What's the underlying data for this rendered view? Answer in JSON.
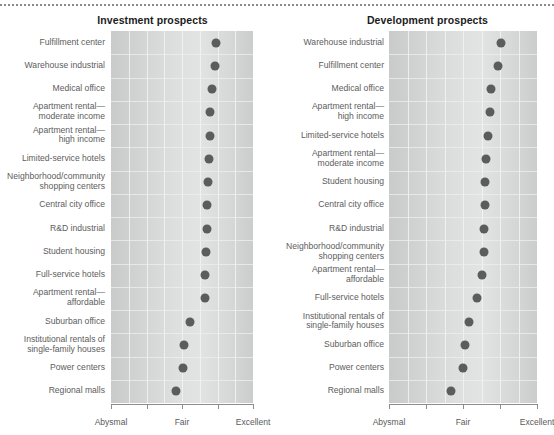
{
  "figure": {
    "top_rule": "dotted-rule"
  },
  "axis": {
    "ticks": [
      "Abysmal",
      "Fair",
      "Excellent"
    ],
    "tick_values": [
      1,
      3,
      5
    ],
    "min": 1,
    "max": 5,
    "minor_ticks": [
      2,
      4
    ]
  },
  "colors": {
    "dot": "#5c5c5c",
    "plot_background": "#d9dbdb",
    "title_text": "#1b1b1b",
    "label_text": "#5d5d5d",
    "axis_line": "#8d8d8d"
  },
  "panels": [
    {
      "id": "investment",
      "title": "Investment prospects"
    },
    {
      "id": "development",
      "title": "Development prospects"
    }
  ],
  "chart_data": [
    {
      "type": "scatter",
      "title": "Investment prospects",
      "xlabel": "",
      "ylabel": "",
      "xlim": [
        1,
        5
      ],
      "grid": true,
      "legend": "none",
      "tick_labels": [
        "Abysmal",
        "Fair",
        "Excellent"
      ],
      "tick_positions": [
        1,
        3,
        5
      ],
      "categories": [
        "Fulfillment center",
        "Warehouse industrial",
        "Medical office",
        "Apartment rental—\nmoderate income",
        "Apartment rental—\nhigh income",
        "Limited-service hotels",
        "Neighborhood/community\nshopping centers",
        "Central city office",
        "R&D industrial",
        "Student housing",
        "Full-service hotels",
        "Apartment rental—\naffordable",
        "Suburban office",
        "Institutional rentals of\nsingle-family houses",
        "Power centers",
        "Regional malls"
      ],
      "values": [
        3.95,
        3.93,
        3.84,
        3.8,
        3.79,
        3.77,
        3.74,
        3.71,
        3.69,
        3.68,
        3.65,
        3.64,
        3.21,
        3.05,
        3.03,
        2.82
      ]
    },
    {
      "type": "scatter",
      "title": "Development prospects",
      "xlabel": "",
      "ylabel": "",
      "xlim": [
        1,
        5
      ],
      "grid": true,
      "legend": "none",
      "tick_labels": [
        "Abysmal",
        "Fair",
        "Excellent"
      ],
      "tick_positions": [
        1,
        3,
        5
      ],
      "categories": [
        "Warehouse industrial",
        "Fulfillment center",
        "Medical office",
        "Apartment rental—\nhigh income",
        "Limited-service hotels",
        "Apartment rental—\nmoderate income",
        "Student housing",
        "Central city office",
        "R&D industrial",
        "Neighborhood/community\nshopping centers",
        "Apartment rental—\naffordable",
        "Full-service hotels",
        "Institutional rentals of\nsingle-family houses",
        "Suburban office",
        "Power centers",
        "Regional malls"
      ],
      "values": [
        4.02,
        3.94,
        3.76,
        3.72,
        3.67,
        3.62,
        3.6,
        3.58,
        3.57,
        3.56,
        3.51,
        3.38,
        3.15,
        3.06,
        3.0,
        2.68
      ]
    }
  ]
}
